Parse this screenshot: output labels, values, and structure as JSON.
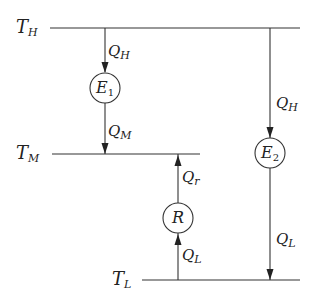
{
  "diagram": {
    "type": "heat-engine-refrigerator-reservoirs",
    "reservoirs": [
      {
        "id": "TH",
        "symbol": "T",
        "sub": "H"
      },
      {
        "id": "TM",
        "symbol": "T",
        "sub": "M"
      },
      {
        "id": "TL",
        "symbol": "T",
        "sub": "L"
      }
    ],
    "devices": [
      {
        "id": "E1",
        "symbol": "E",
        "sub": "1"
      },
      {
        "id": "E2",
        "symbol": "E",
        "sub": "2"
      },
      {
        "id": "R",
        "symbol": "R",
        "sub": ""
      }
    ],
    "flows": [
      {
        "id": "e1_in",
        "symbol": "Q",
        "sub": "H",
        "from": "TH",
        "to": "E1"
      },
      {
        "id": "e1_out",
        "symbol": "Q",
        "sub": "M",
        "from": "E1",
        "to": "TM"
      },
      {
        "id": "r_out",
        "symbol": "Q",
        "sub": "r",
        "from": "R",
        "to": "TM"
      },
      {
        "id": "r_in",
        "symbol": "Q",
        "sub": "L",
        "from": "TL",
        "to": "R"
      },
      {
        "id": "e2_in",
        "symbol": "Q",
        "sub": "H",
        "from": "TH",
        "to": "E2"
      },
      {
        "id": "e2_out",
        "symbol": "Q",
        "sub": "L",
        "from": "E2",
        "to": "TL"
      }
    ],
    "colors": {
      "stroke": "#222222",
      "background": "#ffffff"
    }
  }
}
